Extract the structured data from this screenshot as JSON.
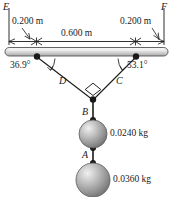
{
  "figure": {
    "type": "physics-free-body-diagram",
    "width_px": 173,
    "height_px": 197,
    "background": "#ffffff",
    "ink_color": "#1a1a1a"
  },
  "bar": {
    "name": "horizontal-bar",
    "left_end_label": "E",
    "right_end_label": "F",
    "fill_top": "#f2f2f2",
    "fill_bottom": "#b4b4b4",
    "stroke": "#4d4d4d"
  },
  "dimensions": [
    {
      "id": "left-offset",
      "label": "0.200 m"
    },
    {
      "id": "middle-span",
      "label": "0.600 m"
    },
    {
      "id": "right-offset",
      "label": "0.200 m"
    }
  ],
  "angles": [
    {
      "id": "left-angle",
      "label": "36.9°",
      "vertex": "left-attachment"
    },
    {
      "id": "right-angle",
      "label": "53.1°",
      "vertex": "right-attachment"
    }
  ],
  "right_angle_marker": {
    "id": "right-angle-square",
    "label": "90°",
    "at": "junction-of-cords-C-and-D"
  },
  "cords": [
    {
      "id": "cord-D",
      "label": "D",
      "from": "left-attachment",
      "to": "junction"
    },
    {
      "id": "cord-C",
      "label": "C",
      "from": "right-attachment",
      "to": "junction"
    },
    {
      "id": "cord-B",
      "label": "B",
      "from": "junction",
      "to": "upper-sphere"
    },
    {
      "id": "cord-A",
      "label": "A",
      "from": "upper-sphere",
      "to": "lower-sphere"
    }
  ],
  "spheres": [
    {
      "id": "upper-sphere",
      "mass_label": "0.0240 kg",
      "radius_px": 14
    },
    {
      "id": "lower-sphere",
      "mass_label": "0.0360 kg",
      "radius_px": 17
    }
  ]
}
